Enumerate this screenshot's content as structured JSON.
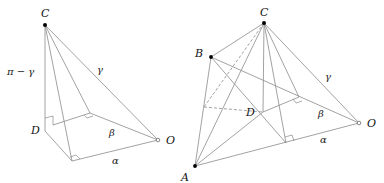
{
  "figures": [
    {
      "id": "left",
      "labels": {
        "C": "C",
        "D": "D",
        "O": "O",
        "alpha": "α",
        "beta": "β",
        "gamma": "γ",
        "pi_minus_gamma": "π − γ"
      }
    },
    {
      "id": "right",
      "labels": {
        "A": "A",
        "B": "B",
        "C": "C",
        "D": "D",
        "O": "O",
        "alpha": "α",
        "beta": "β",
        "gamma": "γ"
      }
    }
  ],
  "colors": {
    "line": "#8a8a8a",
    "point": "#000000",
    "label": "#111111"
  }
}
